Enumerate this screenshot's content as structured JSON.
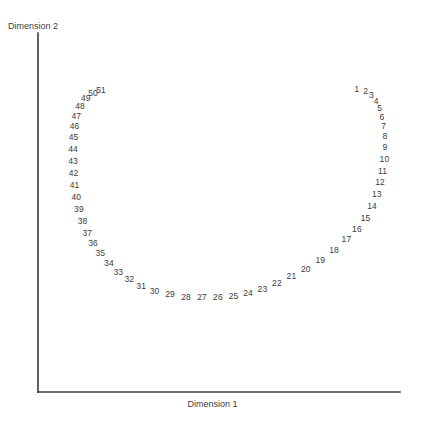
{
  "chart_data": {
    "type": "scatter",
    "title": "",
    "xlabel": "Dimension 1",
    "ylabel": "Dimension 2",
    "grid": false,
    "legend": "none",
    "xlim": [
      0,
      1
    ],
    "ylim": [
      0,
      1
    ],
    "point_style": "numeric-label-only",
    "labels": [
      "1",
      "2",
      "3",
      "4",
      "5",
      "6",
      "7",
      "8",
      "9",
      "10",
      "11",
      "12",
      "13",
      "14",
      "15",
      "16",
      "17",
      "18",
      "19",
      "20",
      "21",
      "22",
      "23",
      "24",
      "25",
      "26",
      "27",
      "28",
      "29",
      "30",
      "31",
      "32",
      "33",
      "34",
      "35",
      "36",
      "37",
      "38",
      "39",
      "40",
      "41",
      "42",
      "43",
      "44",
      "45",
      "46",
      "47",
      "48",
      "49",
      "50",
      "51"
    ],
    "x": [
      0.881,
      0.905,
      0.921,
      0.934,
      0.944,
      0.95,
      0.955,
      0.958,
      0.958,
      0.957,
      0.952,
      0.945,
      0.936,
      0.923,
      0.905,
      0.881,
      0.852,
      0.818,
      0.78,
      0.74,
      0.7,
      0.66,
      0.62,
      0.58,
      0.54,
      0.497,
      0.453,
      0.409,
      0.365,
      0.322,
      0.285,
      0.252,
      0.222,
      0.196,
      0.172,
      0.152,
      0.136,
      0.123,
      0.113,
      0.106,
      0.101,
      0.098,
      0.097,
      0.097,
      0.098,
      0.101,
      0.106,
      0.116,
      0.132,
      0.152,
      0.174
    ],
    "y": [
      0.845,
      0.838,
      0.826,
      0.81,
      0.79,
      0.766,
      0.74,
      0.712,
      0.682,
      0.65,
      0.617,
      0.584,
      0.551,
      0.518,
      0.486,
      0.455,
      0.425,
      0.396,
      0.369,
      0.344,
      0.322,
      0.303,
      0.287,
      0.275,
      0.268,
      0.264,
      0.264,
      0.266,
      0.272,
      0.282,
      0.296,
      0.314,
      0.335,
      0.359,
      0.386,
      0.414,
      0.444,
      0.476,
      0.509,
      0.542,
      0.576,
      0.61,
      0.644,
      0.677,
      0.709,
      0.74,
      0.769,
      0.796,
      0.818,
      0.833,
      0.842
    ]
  },
  "axes": {
    "x_title": "Dimension 1",
    "y_title": "Dimension 2"
  }
}
